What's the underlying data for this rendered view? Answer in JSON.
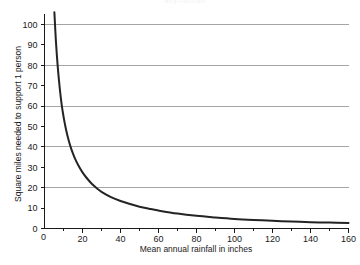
{
  "figure": {
    "partial_top_text": "ally-rainfall",
    "background_color": "#ffffff",
    "curve_color": "#242424",
    "grid_color": "#8d8d8d",
    "axis_color": "#1a1a1a"
  },
  "chart_data": {
    "type": "line",
    "title": "",
    "xlabel": "Mean annual rainfall in inches",
    "ylabel": "Square miles needed to support 1 person",
    "xlim": [
      0,
      160
    ],
    "ylim": [
      0,
      105
    ],
    "xticks": [
      0,
      20,
      40,
      60,
      80,
      100,
      120,
      140,
      160
    ],
    "xtick_labels": [
      "0",
      "20",
      "40",
      "60",
      "80",
      "100",
      "120",
      "140",
      "160"
    ],
    "xminor_ticks": [
      10,
      30,
      50,
      70,
      90,
      110,
      130,
      150
    ],
    "yticks": [
      0,
      10,
      20,
      30,
      40,
      50,
      60,
      70,
      80,
      90,
      100
    ],
    "ytick_labels": [
      "0",
      "10",
      "20",
      "30",
      "40",
      "50",
      "60",
      "70",
      "80",
      "90",
      "100"
    ],
    "gridlines_y": [
      20,
      40,
      60,
      80,
      100
    ],
    "grid": "horizontal-only",
    "legend": "none",
    "series": [
      {
        "name": "Square miles per person vs rainfall",
        "relationship": "inverse hyperbolic, approx y = 550 / x with asymptote near y = 2",
        "x": [
          5.2,
          6,
          7,
          8,
          9,
          10,
          11,
          12,
          13,
          14,
          15,
          16,
          18,
          20,
          22,
          25,
          28,
          30,
          35,
          40,
          45,
          50,
          55,
          60,
          70,
          80,
          90,
          100,
          110,
          120,
          130,
          140,
          150,
          160
        ],
        "y": [
          106,
          92,
          79,
          69,
          61,
          55,
          50,
          45.8,
          42.3,
          39.3,
          36.7,
          34.4,
          30.6,
          27.5,
          25,
          21.8,
          19.4,
          18,
          15.4,
          13.5,
          12,
          10.7,
          9.7,
          8.8,
          7.3,
          6.2,
          5.4,
          4.7,
          4.2,
          3.8,
          3.4,
          3.1,
          2.9,
          2.7
        ]
      }
    ]
  }
}
